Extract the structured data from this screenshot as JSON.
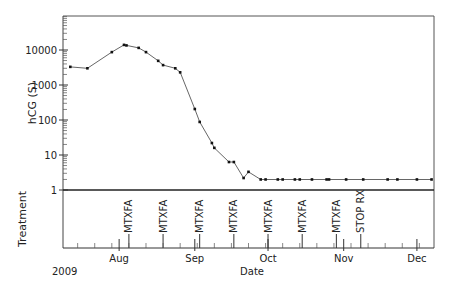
{
  "chart_data": {
    "type": "line",
    "title": "",
    "xlabel": "Date",
    "ylabel": "hCG (S)",
    "yscale": "log",
    "ylim": [
      1,
      100000
    ],
    "year_label": "2009",
    "x_range": [
      "2009-07-09",
      "2009-12-08"
    ],
    "y_ticks": [
      {
        "value": 1,
        "label": "1"
      },
      {
        "value": 10,
        "label": "10"
      },
      {
        "value": 100,
        "label": "100"
      },
      {
        "value": 1000,
        "label": "1000"
      },
      {
        "value": 10000,
        "label": "10000"
      }
    ],
    "x_ticks": [
      {
        "date": "2009-08-01",
        "label": "Aug"
      },
      {
        "date": "2009-09-01",
        "label": "Sep"
      },
      {
        "date": "2009-10-01",
        "label": "Oct"
      },
      {
        "date": "2009-11-01",
        "label": "Nov"
      },
      {
        "date": "2009-12-01",
        "label": "Dec"
      }
    ],
    "grid": false,
    "legend": null,
    "series": [
      {
        "name": "hCG (S)",
        "color": "#333333",
        "points": [
          {
            "date": "2009-07-12",
            "value": 3300
          },
          {
            "date": "2009-07-19",
            "value": 3000
          },
          {
            "date": "2009-07-29",
            "value": 8700
          },
          {
            "date": "2009-08-03",
            "value": 14000
          },
          {
            "date": "2009-08-04",
            "value": 13500
          },
          {
            "date": "2009-08-09",
            "value": 11500
          },
          {
            "date": "2009-08-12",
            "value": 8700
          },
          {
            "date": "2009-08-17",
            "value": 4900
          },
          {
            "date": "2009-08-19",
            "value": 3700
          },
          {
            "date": "2009-08-24",
            "value": 3000
          },
          {
            "date": "2009-08-26",
            "value": 2300
          },
          {
            "date": "2009-09-01",
            "value": 206
          },
          {
            "date": "2009-09-03",
            "value": 88
          },
          {
            "date": "2009-09-08",
            "value": 22
          },
          {
            "date": "2009-09-09",
            "value": 16
          },
          {
            "date": "2009-09-15",
            "value": 6.3
          },
          {
            "date": "2009-09-17",
            "value": 6.3
          },
          {
            "date": "2009-09-21",
            "value": 2.2
          },
          {
            "date": "2009-09-23",
            "value": 3.3
          },
          {
            "date": "2009-09-28",
            "value": 2
          },
          {
            "date": "2009-09-30",
            "value": 2
          },
          {
            "date": "2009-10-05",
            "value": 2
          },
          {
            "date": "2009-10-07",
            "value": 2
          },
          {
            "date": "2009-10-12",
            "value": 2
          },
          {
            "date": "2009-10-14",
            "value": 2
          },
          {
            "date": "2009-10-19",
            "value": 2
          },
          {
            "date": "2009-10-25",
            "value": 2
          },
          {
            "date": "2009-10-26",
            "value": 2
          },
          {
            "date": "2009-11-02",
            "value": 2
          },
          {
            "date": "2009-11-09",
            "value": 2
          },
          {
            "date": "2009-11-19",
            "value": 2
          },
          {
            "date": "2009-11-23",
            "value": 2
          },
          {
            "date": "2009-12-01",
            "value": 2
          },
          {
            "date": "2009-12-07",
            "value": 2
          }
        ]
      }
    ],
    "treatment_panel": {
      "label": "Treatment",
      "events": [
        {
          "date": "2009-08-05",
          "label": "MTXFA"
        },
        {
          "date": "2009-08-19",
          "label": "MTXFA"
        },
        {
          "date": "2009-09-03",
          "label": "MTXFA"
        },
        {
          "date": "2009-09-17",
          "label": "MTXFA"
        },
        {
          "date": "2009-10-01",
          "label": "MTXFA"
        },
        {
          "date": "2009-10-15",
          "label": "MTXFA"
        },
        {
          "date": "2009-10-29",
          "label": "MTXFA"
        },
        {
          "date": "2009-11-08",
          "label": "STOP RX"
        }
      ]
    }
  }
}
